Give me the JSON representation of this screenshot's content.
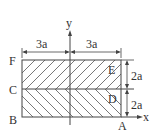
{
  "diagram": {
    "points": {
      "A": "A",
      "B": "B",
      "C": "C",
      "D": "D",
      "E": "E",
      "F": "F"
    },
    "axes": {
      "x": "x",
      "y": "y"
    },
    "dimensions": {
      "left_width": "3a",
      "right_width": "3a",
      "upper_height": "2a",
      "lower_height": "2a"
    },
    "colors": {
      "line": "#444444",
      "hatch": "#555555",
      "background": "#ffffff"
    }
  }
}
